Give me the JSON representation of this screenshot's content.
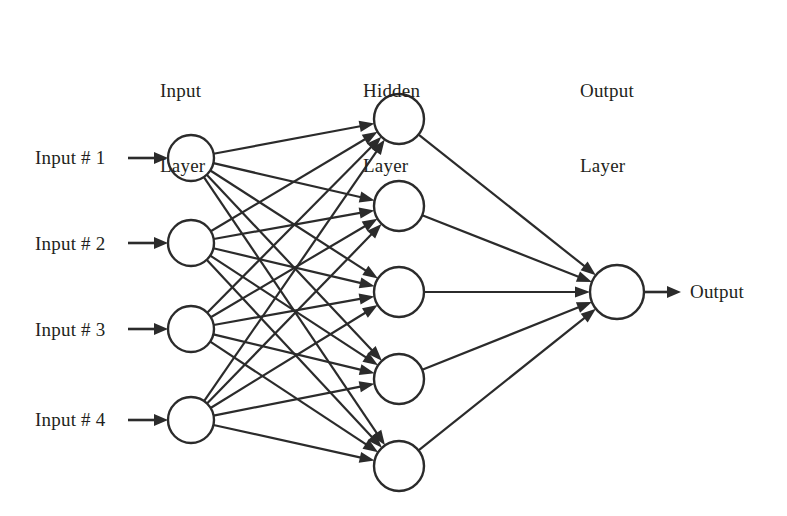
{
  "diagram": {
    "type": "neural-network-architecture",
    "background_color": "#ffffff",
    "stroke_color": "#2b2b2b",
    "text_color": "#231f20",
    "layer_titles": [
      {
        "name": "input-layer-title",
        "line1": "Input",
        "line2": "Layer",
        "x": 160,
        "y": 28
      },
      {
        "name": "hidden-layer-title",
        "line1": "Hidden",
        "line2": "Layer",
        "x": 363,
        "y": 28
      },
      {
        "name": "output-layer-title",
        "line1": "Output",
        "line2": "Layer",
        "x": 580,
        "y": 28
      }
    ],
    "input_labels": [
      {
        "text": "Input # 1",
        "x": 35,
        "y": 147
      },
      {
        "text": "Input # 2",
        "x": 35,
        "y": 233
      },
      {
        "text": "Input # 3",
        "x": 35,
        "y": 319
      },
      {
        "text": "Input # 4",
        "x": 35,
        "y": 409
      }
    ],
    "output_label": {
      "text": "Output",
      "x": 690,
      "y": 281
    },
    "layers": [
      {
        "name": "input-layer",
        "count": 4,
        "radius": 23,
        "nodes": [
          {
            "id": "in-1",
            "cx": 191,
            "cy": 158
          },
          {
            "id": "in-2",
            "cx": 191,
            "cy": 243
          },
          {
            "id": "in-3",
            "cx": 191,
            "cy": 329
          },
          {
            "id": "in-4",
            "cx": 191,
            "cy": 420
          }
        ]
      },
      {
        "name": "hidden-layer",
        "count": 5,
        "radius": 25,
        "nodes": [
          {
            "id": "hid-1",
            "cx": 399,
            "cy": 119
          },
          {
            "id": "hid-2",
            "cx": 399,
            "cy": 206
          },
          {
            "id": "hid-3",
            "cx": 399,
            "cy": 292
          },
          {
            "id": "hid-4",
            "cx": 399,
            "cy": 379
          },
          {
            "id": "hid-5",
            "cx": 399,
            "cy": 466
          }
        ]
      },
      {
        "name": "output-layer",
        "count": 1,
        "radius": 27,
        "nodes": [
          {
            "id": "out-1",
            "cx": 617,
            "cy": 292
          }
        ]
      }
    ],
    "external_inputs": [
      {
        "id": "ext-in-1",
        "x1": 128,
        "y1": 158,
        "to": "in-1"
      },
      {
        "id": "ext-in-2",
        "x1": 128,
        "y1": 243,
        "to": "in-2"
      },
      {
        "id": "ext-in-3",
        "x1": 128,
        "y1": 329,
        "to": "in-3"
      },
      {
        "id": "ext-in-4",
        "x1": 128,
        "y1": 420,
        "to": "in-4"
      }
    ],
    "external_output": {
      "id": "ext-out-1",
      "from": "out-1",
      "x2": 681,
      "y2": 292
    },
    "connections_note": "fully connected: every input node to every hidden node (20 edges); every hidden node to the output node (5 edges)",
    "edge_counts": {
      "input_to_hidden": 20,
      "hidden_to_output": 5,
      "external_in": 4,
      "external_out": 1
    }
  }
}
